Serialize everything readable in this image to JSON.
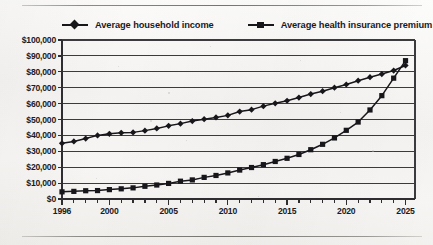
{
  "figure": {
    "background_color": "#f4f2f0",
    "ink_color": "#17161a",
    "top_rule": "horizontal-rule",
    "bottom_rule": "horizontal-rule"
  },
  "legend": {
    "position": "top",
    "entries": [
      {
        "label": "Average household income",
        "marker": "diamond",
        "color": "#17161a"
      },
      {
        "label": "Average health insurance premium",
        "marker": "square",
        "color": "#17161a"
      }
    ]
  },
  "axes": {
    "y_tick_labels": [
      "$100,000",
      "$90,000",
      "$80,000",
      "$70,000",
      "$60,000",
      "$50,000",
      "$40,000",
      "$30,000",
      "$20,000",
      "$10,000",
      "$0"
    ],
    "x_tick_labels": [
      "1996",
      "2000",
      "2005",
      "2010",
      "2015",
      "2020",
      "2025"
    ]
  },
  "chart_data": {
    "type": "line",
    "title": "",
    "subtitle": "",
    "xlabel": "",
    "ylabel": "",
    "xlim": [
      1996,
      2025.8
    ],
    "ylim": [
      0,
      100000
    ],
    "ytick_step": 10000,
    "grid": true,
    "grid_axis": "y",
    "legend_position": "top",
    "x": [
      1996,
      1997,
      1998,
      1999,
      2000,
      2001,
      2002,
      2003,
      2004,
      2005,
      2006,
      2007,
      2008,
      2009,
      2010,
      2011,
      2012,
      2013,
      2014,
      2015,
      2016,
      2017,
      2018,
      2019,
      2020,
      2021,
      2022,
      2023,
      2024,
      2025
    ],
    "series": [
      {
        "name": "Average household income",
        "marker": "diamond",
        "color": "#17161a",
        "values": [
          35000,
          36200,
          38000,
          40000,
          41000,
          41600,
          41900,
          43000,
          44400,
          46000,
          47400,
          49000,
          50200,
          51300,
          52600,
          55000,
          56200,
          58400,
          60200,
          61800,
          63800,
          66000,
          67800,
          70000,
          72000,
          74400,
          76600,
          78600,
          80800,
          84000
        ]
      },
      {
        "name": "Average health insurance premium",
        "marker": "square",
        "color": "#17161a",
        "values": [
          4500,
          4800,
          5200,
          5300,
          5900,
          6400,
          7000,
          8000,
          8800,
          9800,
          11200,
          12000,
          13600,
          14800,
          16400,
          18200,
          19800,
          21600,
          23600,
          25600,
          28000,
          31000,
          34400,
          38400,
          43200,
          48400,
          56000,
          65000,
          76000,
          87000
        ]
      }
    ]
  }
}
